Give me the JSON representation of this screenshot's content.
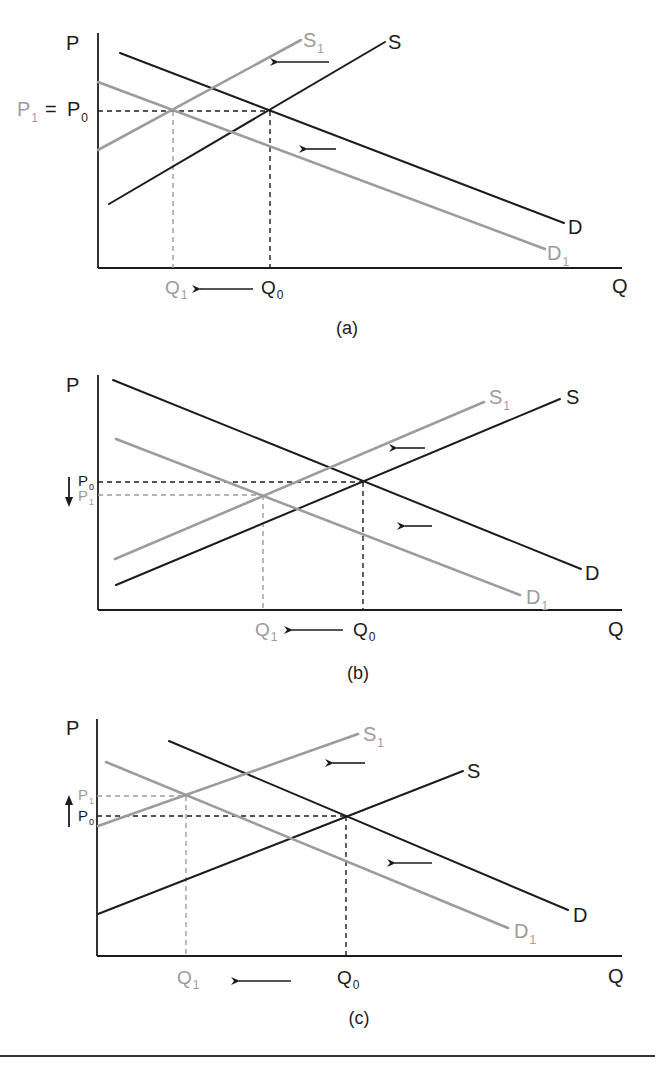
{
  "colors": {
    "black": "#1c1c1c",
    "gray": "#9c9c9c",
    "rule": "#333333"
  },
  "panels": [
    {
      "id": "a",
      "caption": "(a)",
      "caption_pos": [
        347,
        334
      ],
      "axes": {
        "x0": 98,
        "ytop": 33,
        "yaxis": 268,
        "xend": 622
      },
      "axis_labels": {
        "p": "P",
        "p_pos": [
          66,
          50
        ],
        "q": "Q",
        "q_pos": [
          612,
          293
        ]
      },
      "curves": [
        {
          "name": "D",
          "color": "black",
          "from": [
            120,
            53
          ],
          "to": [
            564,
            223
          ],
          "label": "D",
          "sub": "",
          "label_pos": [
            568,
            234
          ]
        },
        {
          "name": "S",
          "color": "black",
          "from": [
            109,
            204
          ],
          "to": [
            385,
            42
          ],
          "label": "S",
          "sub": "",
          "label_pos": [
            388,
            49
          ]
        },
        {
          "name": "S1",
          "color": "gray",
          "from": [
            98,
            150
          ],
          "to": [
            301,
            40
          ],
          "label": "S",
          "sub": "1",
          "label_pos": [
            303,
            47
          ]
        },
        {
          "name": "D1",
          "color": "gray",
          "from": [
            98,
            82
          ],
          "to": [
            545,
            249
          ],
          "label": "D",
          "sub": "1",
          "label_pos": [
            547,
            260
          ]
        }
      ],
      "hdash": [
        {
          "y": 111,
          "x1": 98,
          "x2": 270,
          "color": "black"
        }
      ],
      "vdash": [
        {
          "x": 173,
          "y1": 111,
          "y2": 268,
          "color": "gray"
        },
        {
          "x": 270,
          "y1": 111,
          "y2": 268,
          "color": "black"
        }
      ],
      "price_labels": [
        {
          "text": "P",
          "sub": "1",
          "color": "gray",
          "pos": [
            17,
            116
          ]
        },
        {
          "text": "=",
          "sub": "",
          "color": "black",
          "pos": [
            45,
            116
          ]
        },
        {
          "text": "P",
          "sub": "0",
          "color": "black",
          "pos": [
            67,
            116
          ]
        }
      ],
      "qty_labels": [
        {
          "text": "Q",
          "sub": "1",
          "color": "gray",
          "pos": [
            165,
            294
          ]
        },
        {
          "text": "Q",
          "sub": "0",
          "color": "black",
          "pos": [
            261,
            294
          ]
        }
      ],
      "arrows": [
        {
          "from": [
            329,
            62
          ],
          "to": [
            276,
            62
          ]
        },
        {
          "from": [
            336,
            149
          ],
          "to": [
            305,
            149
          ]
        },
        {
          "from": [
            253,
            289
          ],
          "to": [
            198,
            289
          ]
        }
      ],
      "price_arrow": null
    },
    {
      "id": "b",
      "caption": "(b)",
      "caption_pos": [
        358,
        679
      ],
      "axes": {
        "x0": 98,
        "ytop": 375,
        "yaxis": 610,
        "xend": 622
      },
      "axis_labels": {
        "p": "P",
        "p_pos": [
          66,
          392
        ],
        "q": "Q",
        "q_pos": [
          608,
          636
        ]
      },
      "curves": [
        {
          "name": "D",
          "color": "black",
          "from": [
            113,
            380
          ],
          "to": [
            581,
            569
          ],
          "label": "D",
          "sub": "",
          "label_pos": [
            585,
            580
          ]
        },
        {
          "name": "S",
          "color": "black",
          "from": [
            116,
            585
          ],
          "to": [
            560,
            399
          ],
          "label": "S",
          "sub": "",
          "label_pos": [
            566,
            404
          ]
        },
        {
          "name": "S1",
          "color": "gray",
          "from": [
            115,
            559
          ],
          "to": [
            484,
            402
          ],
          "label": "S",
          "sub": "1",
          "label_pos": [
            489,
            404
          ]
        },
        {
          "name": "D1",
          "color": "gray",
          "from": [
            116,
            439
          ],
          "to": [
            520,
            595
          ],
          "label": "D",
          "sub": "1",
          "label_pos": [
            526,
            604
          ]
        }
      ],
      "hdash": [
        {
          "y": 482,
          "x1": 98,
          "x2": 363,
          "color": "black"
        },
        {
          "y": 495,
          "x1": 98,
          "x2": 263,
          "color": "gray"
        }
      ],
      "vdash": [
        {
          "x": 263,
          "y1": 495,
          "y2": 610,
          "color": "gray"
        },
        {
          "x": 363,
          "y1": 482,
          "y2": 610,
          "color": "black"
        }
      ],
      "price_labels": [
        {
          "text": "P",
          "sub": "0",
          "color": "black",
          "pos": [
            78,
            486
          ],
          "small": true
        },
        {
          "text": "P",
          "sub": "1",
          "color": "gray",
          "pos": [
            78,
            501
          ],
          "small": true
        }
      ],
      "qty_labels": [
        {
          "text": "Q",
          "sub": "1",
          "color": "gray",
          "pos": [
            255,
            636
          ]
        },
        {
          "text": "Q",
          "sub": "0",
          "color": "black",
          "pos": [
            353,
            636
          ]
        }
      ],
      "arrows": [
        {
          "from": [
            425,
            448
          ],
          "to": [
            395,
            448
          ]
        },
        {
          "from": [
            432,
            526
          ],
          "to": [
            403,
            526
          ]
        },
        {
          "from": [
            343,
            630
          ],
          "to": [
            290,
            630
          ]
        }
      ],
      "price_arrow": {
        "x": 69,
        "from": 477,
        "to": 507
      }
    },
    {
      "id": "c",
      "caption": "(c)",
      "caption_pos": [
        359,
        1024
      ],
      "axes": {
        "x0": 97,
        "ytop": 719,
        "yaxis": 956,
        "xend": 622
      },
      "axis_labels": {
        "p": "P",
        "p_pos": [
          66,
          735
        ],
        "q": "Q",
        "q_pos": [
          608,
          983
        ]
      },
      "curves": [
        {
          "name": "D",
          "color": "black",
          "from": [
            169,
            741
          ],
          "to": [
            568,
            910
          ],
          "label": "D",
          "sub": "",
          "label_pos": [
            573,
            922
          ]
        },
        {
          "name": "S",
          "color": "black",
          "from": [
            98,
            914
          ],
          "to": [
            463,
            771
          ],
          "label": "S",
          "sub": "",
          "label_pos": [
            467,
            778
          ]
        },
        {
          "name": "S1",
          "color": "gray",
          "from": [
            98,
            826
          ],
          "to": [
            358,
            734
          ],
          "label": "S",
          "sub": "1",
          "label_pos": [
            363,
            741
          ]
        },
        {
          "name": "D1",
          "color": "gray",
          "from": [
            106,
            762
          ],
          "to": [
            508,
            928
          ],
          "label": "D",
          "sub": "1",
          "label_pos": [
            514,
            938
          ]
        }
      ],
      "hdash": [
        {
          "y": 796,
          "x1": 97,
          "x2": 186,
          "color": "gray"
        },
        {
          "y": 816,
          "x1": 97,
          "x2": 346,
          "color": "black"
        }
      ],
      "vdash": [
        {
          "x": 186,
          "y1": 796,
          "y2": 956,
          "color": "gray"
        },
        {
          "x": 346,
          "y1": 816,
          "y2": 956,
          "color": "black"
        }
      ],
      "price_labels": [
        {
          "text": "P",
          "sub": "1",
          "color": "gray",
          "pos": [
            78,
            800
          ],
          "small": true
        },
        {
          "text": "P",
          "sub": "0",
          "color": "black",
          "pos": [
            78,
            821
          ],
          "small": true
        }
      ],
      "qty_labels": [
        {
          "text": "Q",
          "sub": "1",
          "color": "gray",
          "pos": [
            177,
            984
          ]
        },
        {
          "text": "Q",
          "sub": "0",
          "color": "black",
          "pos": [
            337,
            984
          ]
        }
      ],
      "arrows": [
        {
          "from": [
            365,
            763
          ],
          "to": [
            331,
            763
          ]
        },
        {
          "from": [
            432,
            863
          ],
          "to": [
            393,
            863
          ]
        },
        {
          "from": [
            291,
            981
          ],
          "to": [
            237,
            981
          ]
        }
      ],
      "price_arrow": {
        "x": 69,
        "from": 827,
        "to": 795
      }
    }
  ],
  "footer_rule": {
    "y": 1056
  }
}
